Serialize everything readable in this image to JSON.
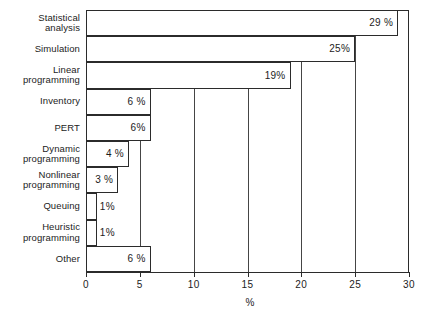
{
  "chart_data": {
    "type": "bar",
    "orientation": "horizontal",
    "title": "",
    "xlabel": "%",
    "ylabel": "",
    "xlim": [
      0,
      30
    ],
    "xticks": [
      0,
      5,
      10,
      15,
      20,
      25,
      30
    ],
    "xtick_labels": [
      "0",
      "5",
      "10",
      "15",
      "20",
      "25",
      "30"
    ],
    "grid": true,
    "legend": null,
    "categories": [
      "Statistical analysis",
      "Simulation",
      "Linear programming",
      "Inventory",
      "PERT",
      "Dynamic programming",
      "Nonlinear programming",
      "Queuing",
      "Heuristic programming",
      "Other"
    ],
    "values": [
      29,
      25,
      19,
      6,
      6,
      4,
      3,
      1,
      1,
      6
    ],
    "value_labels": [
      "29 %",
      "25%",
      "19%",
      "6 %",
      "6%",
      "4 %",
      "3 %",
      "1%",
      "1%",
      "6 %"
    ],
    "bars": [
      {
        "category_lines": [
          "Statistical",
          "analysis"
        ],
        "value": 29,
        "label": "29 %",
        "label_inside": true
      },
      {
        "category_lines": [
          "Simulation"
        ],
        "value": 25,
        "label": "25%",
        "label_inside": true
      },
      {
        "category_lines": [
          "Linear",
          "programming"
        ],
        "value": 19,
        "label": "19%",
        "label_inside": true
      },
      {
        "category_lines": [
          "Inventory"
        ],
        "value": 6,
        "label": "6 %",
        "label_inside": true
      },
      {
        "category_lines": [
          "PERT"
        ],
        "value": 6,
        "label": "6%",
        "label_inside": true
      },
      {
        "category_lines": [
          "Dynamic",
          "programming"
        ],
        "value": 4,
        "label": "4 %",
        "label_inside": true
      },
      {
        "category_lines": [
          "Nonlinear",
          "programming"
        ],
        "value": 3,
        "label": "3 %",
        "label_inside": true
      },
      {
        "category_lines": [
          "Queuing"
        ],
        "value": 1,
        "label": "1%",
        "label_inside": false
      },
      {
        "category_lines": [
          "Heuristic",
          "programming"
        ],
        "value": 1,
        "label": "1%",
        "label_inside": false
      },
      {
        "category_lines": [
          "Other"
        ],
        "value": 6,
        "label": "6 %",
        "label_inside": true
      }
    ]
  },
  "colors": {
    "background": "#ffffff",
    "ink": "#2b2b2b",
    "bar_fill": "#ffffff",
    "gridline": "#454545"
  }
}
